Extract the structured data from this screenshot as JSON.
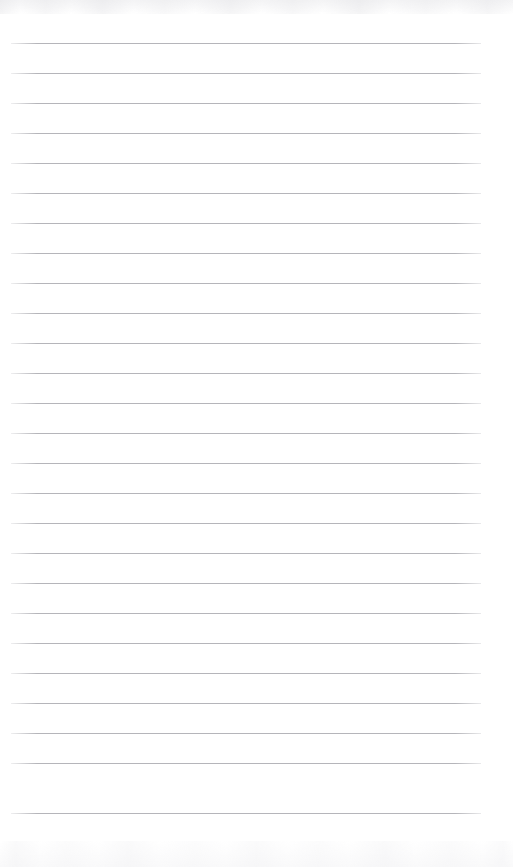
{
  "document": {
    "type": "lined-notepad-page",
    "title": "Lined notepad page",
    "content_text": "",
    "is_blank": true,
    "page_width": 513,
    "page_height": 867
  },
  "paper": {
    "background_color": "#ffffff",
    "rule_color": "#b5b5ba",
    "rule_thickness": 1,
    "rule_spacing": 30,
    "rule_left": 11,
    "rule_right": 481,
    "rule_width": 470,
    "first_rule_y": 43,
    "last_rule_y": 813,
    "rule_count": 26,
    "top_margin": 43,
    "bottom_margin": 54,
    "has_margin_line": false,
    "has_header": false,
    "has_footer": false
  },
  "scan": {
    "top_noise_label": "scan-edge-texture",
    "bottom_noise_label": "scan-edge-texture",
    "noise_color": "#cdcdd3"
  },
  "rules": [
    {
      "index": 1,
      "y": 43
    },
    {
      "index": 2,
      "y": 73
    },
    {
      "index": 3,
      "y": 103
    },
    {
      "index": 4,
      "y": 133
    },
    {
      "index": 5,
      "y": 163
    },
    {
      "index": 6,
      "y": 193
    },
    {
      "index": 7,
      "y": 223
    },
    {
      "index": 8,
      "y": 253
    },
    {
      "index": 9,
      "y": 283
    },
    {
      "index": 10,
      "y": 313
    },
    {
      "index": 11,
      "y": 343
    },
    {
      "index": 12,
      "y": 373
    },
    {
      "index": 13,
      "y": 403
    },
    {
      "index": 14,
      "y": 433
    },
    {
      "index": 15,
      "y": 463
    },
    {
      "index": 16,
      "y": 493
    },
    {
      "index": 17,
      "y": 523
    },
    {
      "index": 18,
      "y": 553
    },
    {
      "index": 19,
      "y": 583
    },
    {
      "index": 20,
      "y": 613
    },
    {
      "index": 21,
      "y": 643
    },
    {
      "index": 22,
      "y": 673
    },
    {
      "index": 23,
      "y": 703
    },
    {
      "index": 24,
      "y": 733
    },
    {
      "index": 25,
      "y": 763
    },
    {
      "index": 26,
      "y": 813
    }
  ]
}
